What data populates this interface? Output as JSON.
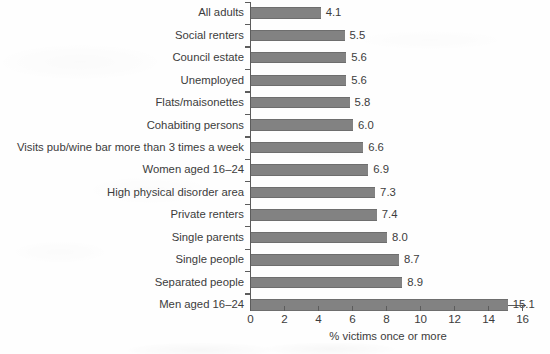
{
  "chart_data": {
    "type": "bar",
    "orientation": "horizontal",
    "title": "",
    "subtitle": "",
    "xlabel": "% victims once or more",
    "ylabel": "",
    "xlim": [
      0,
      16
    ],
    "xticks": [
      0,
      2,
      4,
      6,
      8,
      10,
      12,
      14,
      16
    ],
    "xtick_labels": [
      "0",
      "2",
      "4",
      "6",
      "8",
      "10",
      "12",
      "14",
      "16"
    ],
    "grid": false,
    "legend": null,
    "bar_color": "#828282",
    "bar_edge_color": "#6e6e6e",
    "axis_color": "#5c5c5c",
    "text_color": "#3c3c3c",
    "value_label_format": "one decimal place, placed to the right of each bar",
    "categories": [
      "All adults",
      "Social renters",
      "Council estate",
      "Unemployed",
      "Flats/maisonettes",
      "Cohabiting persons",
      "Visits pub/wine bar more than 3 times a week",
      "Women aged 16–24",
      "High physical disorder area",
      "Private renters",
      "Single parents",
      "Single people",
      "Separated people",
      "Men aged 16–24"
    ],
    "values": [
      4.1,
      5.5,
      5.6,
      5.6,
      5.8,
      6.0,
      6.6,
      6.9,
      7.3,
      7.4,
      8.0,
      8.7,
      8.9,
      15.1
    ],
    "value_labels": [
      "4.1",
      "5.5",
      "5.6",
      "5.6",
      "5.8",
      "6.0",
      "6.6",
      "6.9",
      "7.3",
      "7.4",
      "8.0",
      "8.7",
      "8.9",
      "15.1"
    ]
  }
}
